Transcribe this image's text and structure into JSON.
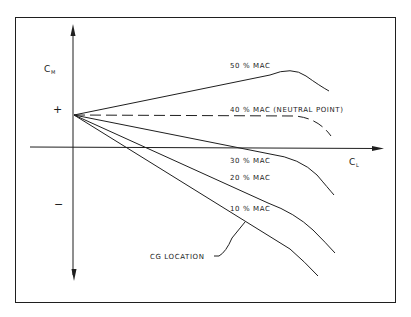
{
  "diagram": {
    "type": "pitching-moment-vs-lift-coefficient",
    "y_axis": {
      "symbol": "C",
      "subscript": "M",
      "positive_sign": "+",
      "negative_sign": "−"
    },
    "x_axis": {
      "symbol": "C",
      "subscript": "L"
    },
    "curves": [
      {
        "id": "mac50",
        "label": "50 % MAC",
        "style": "solid"
      },
      {
        "id": "mac40",
        "label": "40 % MAC  (NEUTRAL POINT)",
        "style": "dashed"
      },
      {
        "id": "mac30",
        "label": "30 % MAC",
        "style": "solid"
      },
      {
        "id": "mac20",
        "label": "20 % MAC",
        "style": "solid"
      },
      {
        "id": "mac10",
        "label": "10 % MAC",
        "style": "solid"
      }
    ],
    "annotation": {
      "label": "CG  LOCATION"
    },
    "colors": {
      "ink": "#1f1f1f",
      "background": "#ffffff"
    }
  }
}
